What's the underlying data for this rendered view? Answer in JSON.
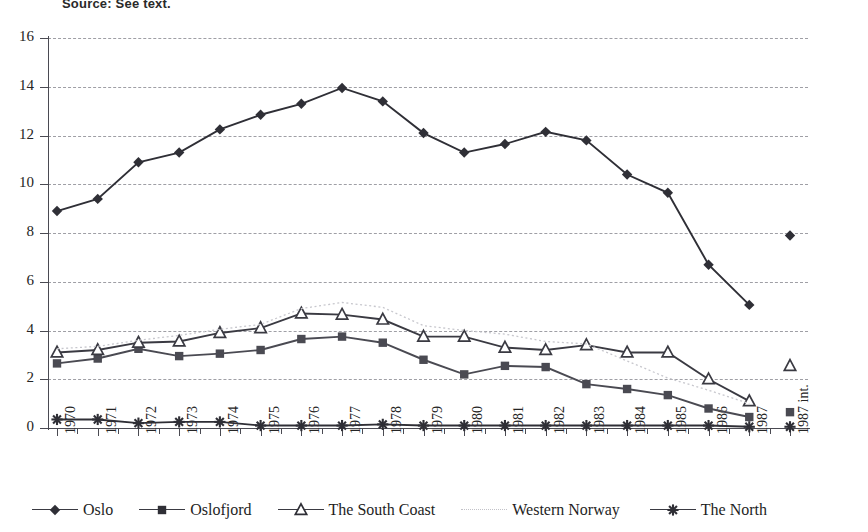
{
  "topnote": "Source: See text.",
  "chart_data": {
    "type": "line",
    "title": "",
    "xlabel": "",
    "ylabel": "",
    "ylim": [
      0,
      16
    ],
    "yticks": [
      0,
      2,
      4,
      6,
      8,
      10,
      12,
      14,
      16
    ],
    "grid": true,
    "legend_position": "bottom",
    "categories": [
      "1970",
      "1971",
      "1972",
      "1973",
      "1974",
      "1975",
      "1976",
      "1977",
      "1978",
      "1979",
      "1980",
      "1981",
      "1982",
      "1983",
      "1984",
      "1985",
      "1986",
      "1987",
      "1987 int."
    ],
    "series": [
      {
        "name": "Oslo",
        "marker": "diamond",
        "color": "#2f2f36",
        "values": [
          8.9,
          9.4,
          10.9,
          11.3,
          12.25,
          12.85,
          13.3,
          13.95,
          13.4,
          12.1,
          11.3,
          11.65,
          12.15,
          11.8,
          10.4,
          9.65,
          6.7,
          5.05,
          7.9
        ],
        "gap_before_last": true
      },
      {
        "name": "Oslofjord",
        "marker": "square",
        "color": "#4a4a52",
        "values": [
          2.65,
          2.85,
          3.25,
          2.95,
          3.05,
          3.2,
          3.65,
          3.75,
          3.5,
          2.8,
          2.2,
          2.55,
          2.5,
          1.8,
          1.6,
          1.35,
          0.8,
          0.45,
          0.65
        ],
        "gap_before_last": true
      },
      {
        "name": "The South Coast",
        "marker": "triangle",
        "color": "#3a3a42",
        "values": [
          3.1,
          3.2,
          3.5,
          3.55,
          3.9,
          4.1,
          4.7,
          4.65,
          4.45,
          3.75,
          3.75,
          3.3,
          3.2,
          3.4,
          3.1,
          3.1,
          2.0,
          1.1,
          2.55
        ],
        "gap_before_last": true
      },
      {
        "name": "Western Norway",
        "marker": "none",
        "color": "#c7c7cd",
        "values": [
          3.25,
          3.35,
          3.6,
          3.8,
          4.05,
          4.25,
          4.9,
          5.15,
          4.95,
          4.2,
          4.0,
          3.85,
          3.55,
          3.45,
          2.75,
          2.05,
          1.55,
          1.0,
          1.0
        ],
        "gap_before_last": true
      },
      {
        "name": "The North",
        "marker": "asterisk",
        "color": "#2f2f36",
        "values": [
          0.35,
          0.35,
          0.2,
          0.25,
          0.25,
          0.1,
          0.1,
          0.1,
          0.15,
          0.1,
          0.1,
          0.1,
          0.1,
          0.1,
          0.1,
          0.1,
          0.1,
          0.05,
          0.05
        ],
        "gap_before_last": true
      }
    ]
  },
  "legend": {
    "items": [
      {
        "label": "Oslo",
        "marker": "diamond"
      },
      {
        "label": "Oslofjord",
        "marker": "square"
      },
      {
        "label": "The South Coast",
        "marker": "triangle"
      },
      {
        "label": "Western Norway",
        "marker": "none"
      },
      {
        "label": "The North",
        "marker": "asterisk"
      }
    ]
  }
}
